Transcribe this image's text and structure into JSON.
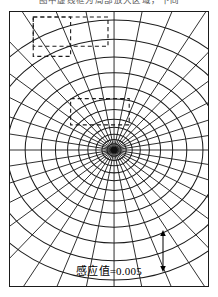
{
  "figure": {
    "top_caption": "图中虚线框为局部放大区域，下同",
    "value_caption": "感应值=0.005",
    "scale_bar": {
      "top_label": "A",
      "bottom_label": "B",
      "name": "section-line-ab"
    },
    "frame": {
      "x": 9,
      "y": 11,
      "width": 198,
      "height": 274,
      "stroke": "#1b1b1b"
    }
  },
  "chart_data": {
    "type": "contour-polar",
    "title": "感应值=0.005",
    "center": {
      "x": 103,
      "y": 137
    },
    "spokes": {
      "count": 36,
      "angle_step_deg": 10,
      "start_angle_deg": 0,
      "stroke": "#1b1b1b",
      "stroke_width": 0.9
    },
    "rings": {
      "count": 13,
      "radii_x": [
        3,
        7,
        12,
        18,
        26,
        35,
        46,
        58,
        72,
        88,
        106,
        126,
        148
      ],
      "radii_y": [
        2.6,
        6.1,
        10.5,
        15.7,
        22.7,
        30.5,
        40.1,
        50.6,
        62.8,
        76.7,
        92.4,
        109.9,
        129.1
      ],
      "aspect_ratio": 0.872,
      "stroke": "#1b1b1b",
      "stroke_width": 1.0
    },
    "contour_value": 0.005,
    "contour_value_label": "感应值=0.005",
    "dashed_boxes": [
      {
        "name": "zoom-region-wide",
        "x": 23,
        "y": 5,
        "width": 74,
        "height": 29
      },
      {
        "name": "zoom-region-square",
        "x": 23,
        "y": 5,
        "width": 37,
        "height": 39
      },
      {
        "name": "zoom-region-inner",
        "x": 60,
        "y": 86,
        "width": 58,
        "height": 26
      }
    ],
    "xlabel": "",
    "ylabel": "",
    "grid": true,
    "legend": "none"
  }
}
